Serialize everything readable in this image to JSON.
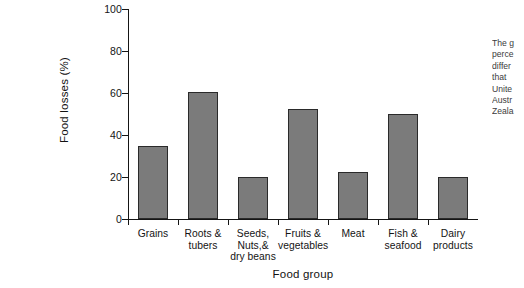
{
  "chart_data": {
    "type": "bar",
    "title": "",
    "xlabel": "Food group",
    "ylabel": "Food losses (%)",
    "ylim": [
      0,
      100
    ],
    "yticks": [
      0,
      20,
      40,
      60,
      80,
      100
    ],
    "grid": false,
    "legend": null,
    "bar_color": "#7b7b7b",
    "bar_edge_color": "#2a2a2a",
    "categories": [
      "Grains",
      "Roots & tubers",
      "Seeds, Nuts,& dry beans",
      "Fruits & vegetables",
      "Meat",
      "Fish & seafood",
      "Dairy products"
    ],
    "category_lines": [
      [
        "Grains"
      ],
      [
        "Roots &",
        "tubers"
      ],
      [
        "Seeds,",
        "Nuts,&",
        "dry beans"
      ],
      [
        "Fruits &",
        "vegetables"
      ],
      [
        "Meat"
      ],
      [
        "Fish &",
        "seafood"
      ],
      [
        "Dairy",
        "products"
      ]
    ],
    "values": [
      35,
      60.5,
      20,
      52.5,
      22.5,
      50,
      20
    ]
  },
  "side_note": {
    "lines": [
      "The g",
      "perce",
      "differ",
      "that",
      "Unite",
      "Austr",
      "Zeala"
    ]
  }
}
